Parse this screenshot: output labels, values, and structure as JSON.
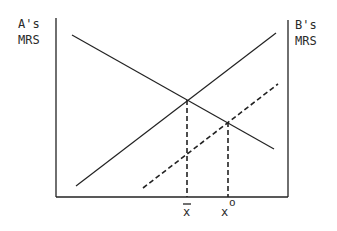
{
  "figure": {
    "left_axis_label": [
      "A's",
      "MRS"
    ],
    "right_axis_label": [
      "B's",
      "MRS"
    ],
    "x_labels": {
      "xbar": "x",
      "xo": "x",
      "xo_superscript": "o"
    },
    "colors": {
      "line": "#222222",
      "background": "#ffffff"
    }
  },
  "diagram": {
    "axes": {
      "left": {
        "x": 56,
        "y_top": 18,
        "y_bottom": 197
      },
      "right": {
        "x": 288,
        "y_top": 20,
        "y_bottom": 197
      },
      "bottom": {
        "y": 197,
        "x_left": 56,
        "x_right": 288
      }
    },
    "lines": [
      {
        "name": "A-MRS-curve",
        "style": "solid",
        "from": [
          72,
          35
        ],
        "to": [
          274,
          149
        ]
      },
      {
        "name": "B-MRS-curve",
        "style": "solid",
        "from": [
          76,
          186
        ],
        "to": [
          276,
          33
        ]
      },
      {
        "name": "B-MRS-shifted",
        "style": "dashed",
        "from": [
          143,
          188
        ],
        "to": [
          278,
          84
        ]
      }
    ],
    "drop_lines": [
      {
        "name": "xbar-drop",
        "x": 187,
        "y_top": 100,
        "y_bottom": 197
      },
      {
        "name": "xo-drop",
        "x": 228,
        "y_top": 122,
        "y_bottom": 197
      }
    ]
  }
}
